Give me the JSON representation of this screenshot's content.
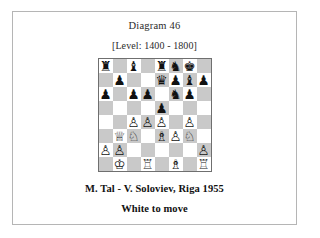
{
  "page": {
    "background_color": "#ffffff",
    "border_color": "#b5b5b5"
  },
  "header": {
    "diagram_title": "Diagram 46",
    "level_line": "[Level: 1400 - 1800]"
  },
  "caption": {
    "game_line": "M. Tal - V. Soloviev, Riga 1955",
    "to_move_line": "White to move"
  },
  "board": {
    "orientation": "white-bottom",
    "light_square_color": "#ffffff",
    "dark_square_color": "#c9c9c9",
    "border_color": "#6f6f6f",
    "files": [
      "a",
      "b",
      "c",
      "d",
      "e",
      "f",
      "g",
      "h"
    ],
    "ranks": [
      8,
      7,
      6,
      5,
      4,
      3,
      2,
      1
    ],
    "side_to_move": "white",
    "piece_glyphs": {
      "wK": "♔",
      "wQ": "♕",
      "wR": "♖",
      "wB": "♗",
      "wN": "♘",
      "wP": "♙",
      "bK": "♚",
      "bQ": "♛",
      "bR": "♜",
      "bB": "♝",
      "bN": "♞",
      "bP": "♟"
    },
    "ranks_data": [
      {
        "rank": 8,
        "squares": [
          {
            "square": "a8",
            "piece": "bR",
            "piece_name": "black-rook"
          },
          {
            "square": "b8",
            "piece": null,
            "piece_name": null
          },
          {
            "square": "c8",
            "piece": "bB",
            "piece_name": "black-bishop"
          },
          {
            "square": "d8",
            "piece": null,
            "piece_name": null
          },
          {
            "square": "e8",
            "piece": "bR",
            "piece_name": "black-rook"
          },
          {
            "square": "f8",
            "piece": "bN",
            "piece_name": "black-knight"
          },
          {
            "square": "g8",
            "piece": "bK",
            "piece_name": "black-king"
          },
          {
            "square": "h8",
            "piece": null,
            "piece_name": null
          }
        ]
      },
      {
        "rank": 7,
        "squares": [
          {
            "square": "a7",
            "piece": null,
            "piece_name": null
          },
          {
            "square": "b7",
            "piece": "bP",
            "piece_name": "black-pawn"
          },
          {
            "square": "c7",
            "piece": null,
            "piece_name": null
          },
          {
            "square": "d7",
            "piece": null,
            "piece_name": null
          },
          {
            "square": "e7",
            "piece": "bQ",
            "piece_name": "black-queen"
          },
          {
            "square": "f7",
            "piece": "bP",
            "piece_name": "black-pawn"
          },
          {
            "square": "g7",
            "piece": "bB",
            "piece_name": "black-bishop"
          },
          {
            "square": "h7",
            "piece": "bP",
            "piece_name": "black-pawn"
          }
        ]
      },
      {
        "rank": 6,
        "squares": [
          {
            "square": "a6",
            "piece": "bP",
            "piece_name": "black-pawn"
          },
          {
            "square": "b6",
            "piece": null,
            "piece_name": null
          },
          {
            "square": "c6",
            "piece": "bP",
            "piece_name": "black-pawn"
          },
          {
            "square": "d6",
            "piece": "bP",
            "piece_name": "black-pawn"
          },
          {
            "square": "e6",
            "piece": null,
            "piece_name": null
          },
          {
            "square": "f6",
            "piece": "bN",
            "piece_name": "black-knight"
          },
          {
            "square": "g6",
            "piece": "bP",
            "piece_name": "black-pawn"
          },
          {
            "square": "h6",
            "piece": null,
            "piece_name": null
          }
        ]
      },
      {
        "rank": 5,
        "squares": [
          {
            "square": "a5",
            "piece": null,
            "piece_name": null
          },
          {
            "square": "b5",
            "piece": null,
            "piece_name": null
          },
          {
            "square": "c5",
            "piece": null,
            "piece_name": null
          },
          {
            "square": "d5",
            "piece": null,
            "piece_name": null
          },
          {
            "square": "e5",
            "piece": "bP",
            "piece_name": "black-pawn"
          },
          {
            "square": "f5",
            "piece": null,
            "piece_name": null
          },
          {
            "square": "g5",
            "piece": null,
            "piece_name": null
          },
          {
            "square": "h5",
            "piece": null,
            "piece_name": null
          }
        ]
      },
      {
        "rank": 4,
        "squares": [
          {
            "square": "a4",
            "piece": null,
            "piece_name": null
          },
          {
            "square": "b4",
            "piece": null,
            "piece_name": null
          },
          {
            "square": "c4",
            "piece": "wP",
            "piece_name": "white-pawn"
          },
          {
            "square": "d4",
            "piece": "wP",
            "piece_name": "white-pawn"
          },
          {
            "square": "e4",
            "piece": "wP",
            "piece_name": "white-pawn"
          },
          {
            "square": "f4",
            "piece": null,
            "piece_name": null
          },
          {
            "square": "g4",
            "piece": "wP",
            "piece_name": "white-pawn"
          },
          {
            "square": "h4",
            "piece": null,
            "piece_name": null
          }
        ]
      },
      {
        "rank": 3,
        "squares": [
          {
            "square": "a3",
            "piece": null,
            "piece_name": null
          },
          {
            "square": "b3",
            "piece": "wQ",
            "piece_name": "white-queen"
          },
          {
            "square": "c3",
            "piece": "wN",
            "piece_name": "white-knight"
          },
          {
            "square": "d3",
            "piece": null,
            "piece_name": null
          },
          {
            "square": "e3",
            "piece": "wB",
            "piece_name": "white-bishop"
          },
          {
            "square": "f3",
            "piece": "wP",
            "piece_name": "white-pawn"
          },
          {
            "square": "g3",
            "piece": "wN",
            "piece_name": "white-knight"
          },
          {
            "square": "h3",
            "piece": null,
            "piece_name": null
          }
        ]
      },
      {
        "rank": 2,
        "squares": [
          {
            "square": "a2",
            "piece": "wP",
            "piece_name": "white-pawn"
          },
          {
            "square": "b2",
            "piece": "wP",
            "piece_name": "white-pawn"
          },
          {
            "square": "c2",
            "piece": null,
            "piece_name": null
          },
          {
            "square": "d2",
            "piece": null,
            "piece_name": null
          },
          {
            "square": "e2",
            "piece": null,
            "piece_name": null
          },
          {
            "square": "f2",
            "piece": null,
            "piece_name": null
          },
          {
            "square": "g2",
            "piece": null,
            "piece_name": null
          },
          {
            "square": "h2",
            "piece": "wP",
            "piece_name": "white-pawn"
          }
        ]
      },
      {
        "rank": 1,
        "squares": [
          {
            "square": "a1",
            "piece": null,
            "piece_name": null
          },
          {
            "square": "b1",
            "piece": "wK",
            "piece_name": "white-king"
          },
          {
            "square": "c1",
            "piece": null,
            "piece_name": null
          },
          {
            "square": "d1",
            "piece": "wR",
            "piece_name": "white-rook"
          },
          {
            "square": "e1",
            "piece": null,
            "piece_name": null
          },
          {
            "square": "f1",
            "piece": "wB",
            "piece_name": "white-bishop"
          },
          {
            "square": "g1",
            "piece": null,
            "piece_name": null
          },
          {
            "square": "h1",
            "piece": "wR",
            "piece_name": "white-rook"
          }
        ]
      }
    ]
  }
}
